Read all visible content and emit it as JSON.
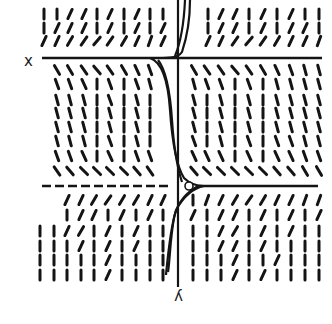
{
  "figure": {
    "type": "slope-field",
    "orientation": "rotated-180",
    "labels": {
      "x_axis": "x",
      "y_axis": "y"
    },
    "colors": {
      "ink": "#141414",
      "background": "#ffffff"
    },
    "axes": {
      "vertical_axis_x": 178,
      "vertical_axis_y_range": [
        0,
        287
      ],
      "upper_equilibrium": {
        "y": 58,
        "x_range": [
          42,
          322
        ],
        "style": "solid"
      },
      "lower_equilibrium": {
        "y": 186,
        "dashed_x_range": [
          42,
          172
        ],
        "solid_x_range": [
          198,
          318
        ]
      }
    },
    "open_circle": {
      "cx": 189,
      "cy": 186,
      "r": 4
    },
    "segment_length": 10,
    "bands": [
      {
        "name": "top-band",
        "rows": [
          14,
          28,
          41
        ],
        "columns": [
          44,
          57,
          70,
          84,
          97,
          110,
          124,
          137,
          150,
          163,
          208,
          221,
          235,
          249,
          263,
          277,
          291,
          305,
          319
        ],
        "angles": [
          [
            90,
            90,
            65,
            65,
            90,
            65,
            90,
            65,
            90,
            90,
            90,
            65,
            65,
            90,
            65,
            90,
            65,
            90,
            90
          ],
          [
            90,
            65,
            65,
            65,
            90,
            65,
            90,
            65,
            90,
            65,
            90,
            65,
            65,
            90,
            65,
            90,
            65,
            65,
            90
          ],
          [
            65,
            65,
            60,
            55,
            50,
            55,
            60,
            65,
            70,
            65,
            65,
            65,
            55,
            50,
            55,
            60,
            65,
            65,
            70
          ]
        ]
      },
      {
        "name": "middle-band",
        "rows": [
          70,
          84,
          100,
          113,
          127,
          141,
          156,
          171
        ],
        "columns": [
          57,
          70,
          84,
          97,
          110,
          124,
          137,
          150,
          194,
          207,
          221,
          235,
          249,
          263,
          277,
          291,
          305,
          319
        ],
        "angles": [
          [
            -60,
            -60,
            -55,
            -50,
            -55,
            -60,
            -65,
            -70,
            -60,
            -55,
            -55,
            -50,
            -55,
            -60,
            -65,
            -70,
            -75,
            -75
          ],
          [
            -70,
            -70,
            -65,
            -90,
            -70,
            -90,
            -70,
            -75,
            -75,
            -70,
            -70,
            -90,
            -70,
            -90,
            -75,
            -75,
            -75,
            -75
          ],
          [
            -75,
            -75,
            -75,
            -90,
            -70,
            -90,
            -75,
            -90,
            -75,
            -90,
            -75,
            -90,
            -75,
            -90,
            -75,
            -75,
            -75,
            -75
          ],
          [
            -75,
            -75,
            -75,
            -90,
            -75,
            -90,
            -75,
            -90,
            -75,
            -90,
            -75,
            -90,
            -75,
            -90,
            -75,
            -75,
            -75,
            -75
          ],
          [
            -75,
            -75,
            -75,
            -90,
            -75,
            -90,
            -75,
            -90,
            -75,
            -90,
            -75,
            -90,
            -75,
            -90,
            -75,
            -75,
            -75,
            -75
          ],
          [
            -75,
            -75,
            -75,
            -90,
            -70,
            -90,
            -75,
            -90,
            -70,
            -90,
            -75,
            -90,
            -70,
            -90,
            -70,
            -70,
            -75,
            -75
          ],
          [
            -70,
            -70,
            -65,
            -90,
            -65,
            -90,
            -70,
            -70,
            -65,
            -65,
            -65,
            -90,
            -65,
            -90,
            -65,
            -65,
            -70,
            -70
          ],
          [
            -55,
            -50,
            -45,
            -45,
            -45,
            -45,
            -50,
            -55,
            -50,
            -45,
            -45,
            -45,
            -45,
            -45,
            -50,
            -50,
            -60,
            -60
          ]
        ]
      },
      {
        "name": "bottom-band",
        "rows": [
          200,
          215,
          231,
          246,
          260,
          275
        ],
        "columns": [
          40,
          54,
          67,
          81,
          94,
          108,
          122,
          136,
          150,
          163,
          193,
          207,
          221,
          235,
          249,
          263,
          277,
          291,
          305,
          319
        ],
        "angles": [
          [
            null,
            null,
            65,
            65,
            60,
            55,
            60,
            60,
            65,
            65,
            90,
            70,
            65,
            60,
            55,
            60,
            65,
            65,
            70,
            70
          ],
          [
            null,
            null,
            90,
            65,
            65,
            90,
            65,
            90,
            65,
            90,
            65,
            90,
            65,
            65,
            90,
            65,
            90,
            65,
            90,
            65
          ],
          [
            90,
            90,
            65,
            60,
            90,
            65,
            90,
            65,
            90,
            90,
            90,
            90,
            65,
            60,
            90,
            65,
            90,
            65,
            90,
            90
          ],
          [
            90,
            90,
            90,
            65,
            90,
            65,
            90,
            65,
            90,
            90,
            90,
            90,
            65,
            65,
            90,
            65,
            90,
            90,
            90,
            90
          ],
          [
            90,
            90,
            90,
            90,
            90,
            65,
            90,
            90,
            90,
            90,
            90,
            90,
            90,
            65,
            90,
            90,
            65,
            90,
            90,
            90
          ],
          [
            90,
            90,
            90,
            90,
            90,
            65,
            90,
            90,
            90,
            90,
            90,
            90,
            90,
            65,
            90,
            65,
            90,
            90,
            90,
            90
          ]
        ]
      }
    ],
    "solution_curves": [
      "M 190 0 C 190 20, 186 40, 182 52 C 178 58, 168 58, 158 58",
      "M 185 0 C 184 22, 180 44, 175 56",
      "M 150 58 C 162 62, 168 80, 170 110 C 172 140, 176 165, 184 178 C 190 184, 196 186, 204 186",
      "M 158 60 C 166 70, 170 90, 172 120 C 174 150, 178 170, 182 182",
      "M 204 186 C 194 188, 184 196, 176 210 C 170 230, 168 255, 166 275",
      "M 198 186 C 188 192, 178 200, 174 218 C 170 240, 170 260, 168 272"
    ]
  }
}
